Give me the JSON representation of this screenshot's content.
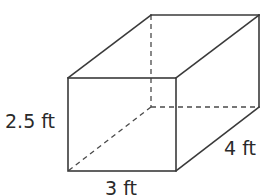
{
  "figure": {
    "type": "rectangular-prism",
    "labels": {
      "height": "2.5 ft",
      "width": "3 ft",
      "depth": "4 ft"
    },
    "dimensions": {
      "height": 2.5,
      "width": 3,
      "depth": 4,
      "unit": "ft"
    },
    "colors": {
      "edge": "#3a3a3a",
      "text": "#2a2a2a",
      "background": "#ffffff"
    }
  }
}
